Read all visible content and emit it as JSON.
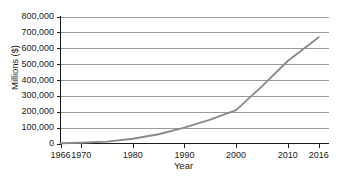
{
  "chart_data": {
    "type": "line",
    "title": "",
    "xlabel": "Year",
    "ylabel": "Millions ($)",
    "xlim": [
      1966,
      2018
    ],
    "ylim": [
      0,
      800000
    ],
    "grid": "horizontal",
    "legend": "none",
    "x_tick_labels": [
      "1966",
      "1970",
      "1980",
      "1990",
      "2000",
      "2010",
      "2016"
    ],
    "x_ticks": [
      1966,
      1970,
      1980,
      1990,
      2000,
      2010,
      2016
    ],
    "y_tick_labels": [
      "0",
      "100,000",
      "200,000",
      "300,000",
      "400,000",
      "500,000",
      "600,000",
      "700,000",
      "800,000"
    ],
    "y_ticks": [
      0,
      100000,
      200000,
      300000,
      400000,
      500000,
      600000,
      700000,
      800000
    ],
    "series": [
      {
        "name": "Value",
        "color": "#8a8a8a",
        "x": [
          1966,
          1970,
          1975,
          1980,
          1985,
          1990,
          1995,
          2000,
          2005,
          2010,
          2016
        ],
        "values": [
          2000,
          5000,
          12000,
          30000,
          58000,
          100000,
          150000,
          210000,
          360000,
          520000,
          670000
        ]
      }
    ]
  },
  "axis": {
    "line_color": "#1a1a1a",
    "grid_color": "#9a9a9a"
  }
}
